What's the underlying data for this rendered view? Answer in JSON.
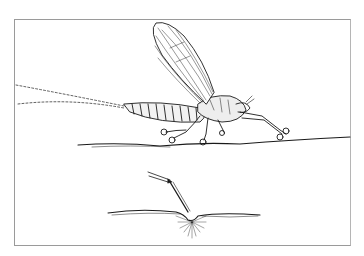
{
  "illustration": {
    "subject": "mayfly dun resting on water surface",
    "style": "pen-and-ink line drawing",
    "colors": {
      "ink": "#1a1a1a",
      "paper": "#ffffff",
      "frame": "#9a9a9a"
    },
    "frame": {
      "x": 14,
      "y": 19,
      "width": 337,
      "height": 227
    },
    "parts": {
      "wing": "large upright veined forewing",
      "body": "segmented abdomen with thorax and head",
      "tails": "two long dotted tails trailing left",
      "legs": "six legs resting on surface film",
      "water_line_upper": "surface line beneath insect",
      "inset": "detail of leg tip dimpling the surface film with light rays below"
    }
  }
}
